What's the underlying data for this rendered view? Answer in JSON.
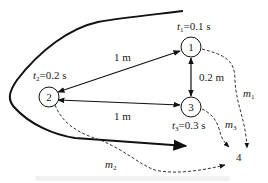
{
  "diagram": {
    "nodes": [
      {
        "id": "1",
        "label": "1",
        "time_var": "t",
        "time_sub": "1",
        "time_value": "=0.1 s",
        "cx": 191,
        "cy": 47
      },
      {
        "id": "2",
        "label": "2",
        "time_var": "t",
        "time_sub": "2",
        "time_value": "=0.2 s",
        "cx": 49,
        "cy": 97
      },
      {
        "id": "3",
        "label": "3",
        "time_var": "t",
        "time_sub": "3",
        "time_value": "=0.3 s",
        "cx": 191,
        "cy": 107
      },
      {
        "id": "4",
        "label": "4"
      }
    ],
    "edges": [
      {
        "from": "2",
        "to": "1",
        "label": "1 m",
        "style": "solid",
        "direction": "both"
      },
      {
        "from": "2",
        "to": "3",
        "label": "1 m",
        "style": "solid",
        "direction": "both"
      },
      {
        "from": "1",
        "to": "3",
        "label": "0.2 m",
        "style": "solid",
        "direction": "both"
      },
      {
        "from": "1",
        "to": "4",
        "label_var": "m",
        "label_sub": "1",
        "style": "dashed"
      },
      {
        "from": "2",
        "to": "4",
        "label_var": "m",
        "label_sub": "2",
        "style": "dashed"
      },
      {
        "from": "3",
        "to": "4",
        "label_var": "m",
        "label_sub": "3",
        "style": "dashed"
      }
    ],
    "boundary": {
      "description": "wavefront-shaped curve",
      "color": "#111111"
    }
  }
}
